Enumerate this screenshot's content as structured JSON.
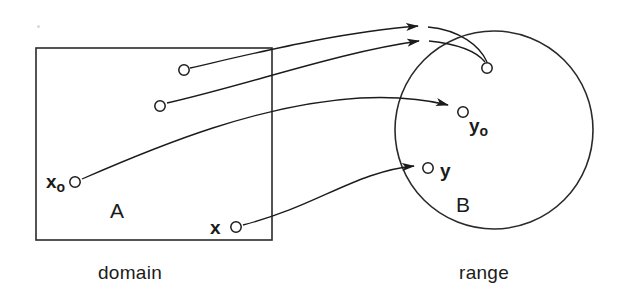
{
  "figure": {
    "type": "mapping-diagram",
    "background_color": "#ffffff",
    "stroke_color": "#1b1b1b",
    "domain": {
      "caption": "domain",
      "set_label": "A",
      "shape": "rectangle",
      "bounds": {
        "x": 36,
        "y": 48,
        "width": 236,
        "height": 192
      },
      "points": [
        {
          "id": "p1",
          "label": "",
          "cx": 184,
          "cy": 70
        },
        {
          "id": "p2",
          "label": "",
          "cx": 160,
          "cy": 106
        },
        {
          "id": "p3",
          "label": "x",
          "subscript": "o",
          "cx": 75,
          "cy": 182
        },
        {
          "id": "p4",
          "label": "x",
          "subscript": "",
          "cx": 236,
          "cy": 227
        }
      ]
    },
    "range": {
      "caption": "range",
      "set_label": "B",
      "shape": "circle",
      "bounds": {
        "cx": 494,
        "cy": 130,
        "r": 99
      },
      "points": [
        {
          "id": "q1",
          "label": "",
          "cx": 487,
          "cy": 68
        },
        {
          "id": "q2",
          "label": "y",
          "subscript": "o",
          "cx": 463,
          "cy": 112
        },
        {
          "id": "q3",
          "label": "y",
          "subscript": "",
          "cx": 428,
          "cy": 168
        }
      ]
    },
    "arrows": [
      {
        "from": "p1",
        "to": "q1",
        "arrowhead_at": {
          "x": 418,
          "y": 26
        }
      },
      {
        "from": "p2",
        "to": "q1",
        "arrowhead_at": {
          "x": 419,
          "y": 41
        }
      },
      {
        "from": "p3",
        "to": "q2",
        "arrowhead_at": {
          "x": 448,
          "y": 105
        }
      },
      {
        "from": "p4",
        "to": "q3",
        "arrowhead_at": {
          "x": 414,
          "y": 166
        }
      }
    ],
    "labels": {
      "x_nought": "x",
      "x_nought_sub": "o",
      "x_plain": "x",
      "y_nought": "y",
      "y_nought_sub": "o",
      "y_plain": "y",
      "set_a": "A",
      "set_b": "B",
      "caption_left": "domain",
      "caption_right": "range"
    }
  }
}
